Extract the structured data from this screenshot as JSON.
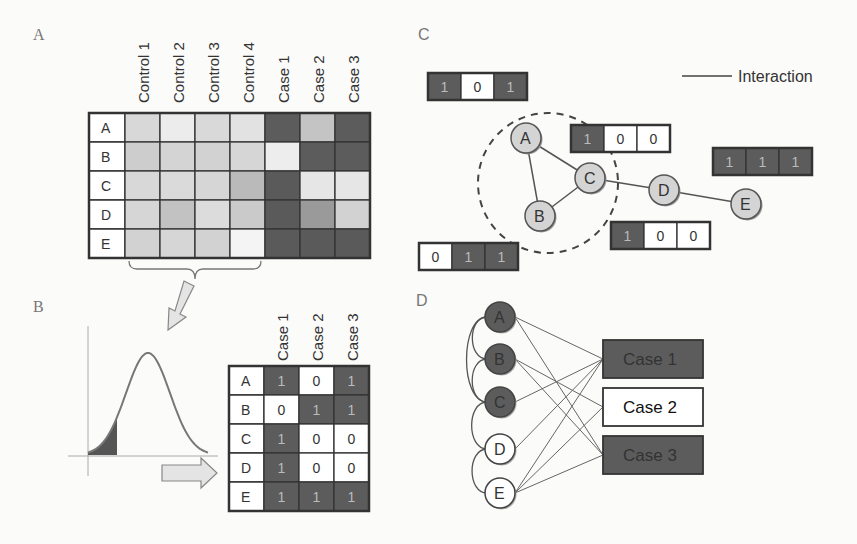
{
  "panels": {
    "A": {
      "label": "A",
      "columns": [
        "Control 1",
        "Control 2",
        "Control 3",
        "Control 4",
        "Case 1",
        "Case 2",
        "Case 3"
      ],
      "rows": [
        "A",
        "B",
        "C",
        "D",
        "E"
      ],
      "shades": [
        [
          "#d8d8d8",
          "#ececec",
          "#d9d9d9",
          "#e2e2e2",
          "#5c5c5c",
          "#c4c4c4",
          "#5c5c5c"
        ],
        [
          "#cdcdcd",
          "#d4d4d4",
          "#d2d2d2",
          "#d6d6d6",
          "#ededed",
          "#5c5c5c",
          "#5c5c5c"
        ],
        [
          "#d8d8d8",
          "#dadada",
          "#d6d6d6",
          "#bababa",
          "#5a5a5a",
          "#e6e6e6",
          "#e6e6e6"
        ],
        [
          "#d6d6d6",
          "#c2c2c2",
          "#dcdcdc",
          "#cacaca",
          "#5a5a5a",
          "#9a9a9a",
          "#d2d2d2"
        ],
        [
          "#d2d2d2",
          "#d6d6d6",
          "#d2d2d2",
          "#f4f4f4",
          "#5a5a5a",
          "#5a5a5a",
          "#5a5a5a"
        ]
      ]
    },
    "B": {
      "label": "B",
      "columns": [
        "Case 1",
        "Case 2",
        "Case 3"
      ],
      "rows": [
        "A",
        "B",
        "C",
        "D",
        "E"
      ],
      "values": [
        [
          "1",
          "0",
          "1"
        ],
        [
          "0",
          "1",
          "1"
        ],
        [
          "1",
          "0",
          "0"
        ],
        [
          "1",
          "0",
          "0"
        ],
        [
          "1",
          "1",
          "1"
        ]
      ]
    },
    "C": {
      "label": "C",
      "legend": "Interaction",
      "nodes": [
        "A",
        "B",
        "C",
        "D",
        "E"
      ],
      "edges": [
        [
          "A",
          "C"
        ],
        [
          "A",
          "B"
        ],
        [
          "B",
          "C"
        ],
        [
          "C",
          "D"
        ],
        [
          "D",
          "E"
        ]
      ],
      "profiles": [
        {
          "node": "A",
          "values": [
            "1",
            "0",
            "1"
          ]
        },
        {
          "node": "C",
          "values": [
            "1",
            "0",
            "0"
          ]
        },
        {
          "node": "E",
          "values": [
            "1",
            "1",
            "1"
          ]
        },
        {
          "node": "B",
          "values": [
            "0",
            "1",
            "1"
          ]
        },
        {
          "node": "D",
          "values": [
            "1",
            "0",
            "0"
          ]
        }
      ]
    },
    "D": {
      "label": "D",
      "genes": [
        {
          "name": "A",
          "filled": true
        },
        {
          "name": "B",
          "filled": true
        },
        {
          "name": "C",
          "filled": true
        },
        {
          "name": "D",
          "filled": false
        },
        {
          "name": "E",
          "filled": false
        }
      ],
      "cases": [
        {
          "name": "Case 1",
          "filled": true
        },
        {
          "name": "Case 2",
          "filled": false
        },
        {
          "name": "Case 3",
          "filled": true
        }
      ],
      "gene_case_links": [
        [
          "A",
          "Case 1"
        ],
        [
          "A",
          "Case 3"
        ],
        [
          "B",
          "Case 2"
        ],
        [
          "B",
          "Case 3"
        ],
        [
          "C",
          "Case 1"
        ],
        [
          "D",
          "Case 1"
        ],
        [
          "E",
          "Case 1"
        ],
        [
          "E",
          "Case 2"
        ],
        [
          "E",
          "Case 3"
        ]
      ],
      "gene_arcs": [
        [
          "A",
          "B"
        ],
        [
          "A",
          "C"
        ],
        [
          "B",
          "C"
        ],
        [
          "C",
          "D"
        ],
        [
          "D",
          "E"
        ]
      ]
    }
  },
  "colors": {
    "dark": "#5c5c5c",
    "node_light": "#d4d4d4",
    "line": "#555555",
    "arrow_fill": "#e4e4e4"
  }
}
